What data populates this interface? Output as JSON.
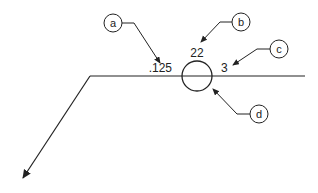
{
  "diagram": {
    "type": "welding-symbol-reference-line",
    "values": {
      "left": ".125",
      "top": "22",
      "right": "3"
    },
    "callouts": [
      {
        "id": "a",
        "label": "a",
        "points_to": ".125"
      },
      {
        "id": "b",
        "label": "b",
        "points_to": "22"
      },
      {
        "id": "c",
        "label": "c",
        "points_to": "3"
      },
      {
        "id": "d",
        "label": "d",
        "points_to": "circle-symbol"
      }
    ],
    "colors": {
      "stroke": "#222222",
      "background": "#ffffff"
    }
  }
}
